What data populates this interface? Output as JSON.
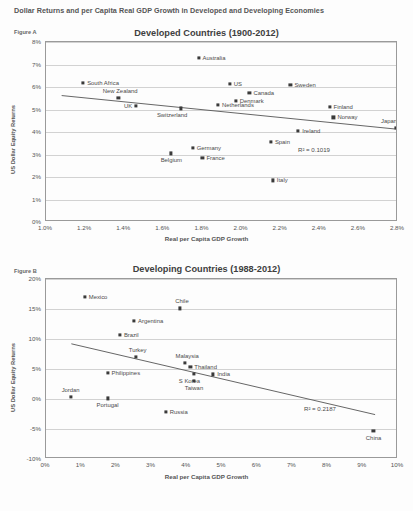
{
  "document": {
    "title": "Dollar Returns and per Capita Real GDP Growth in Developed and Developing Economies",
    "caption": ""
  },
  "figure_a": {
    "figure_label": "Figure A",
    "chart_data": {
      "type": "scatter",
      "title": "Developed Countries  (1900-2012)",
      "xlabel": "Real per Capita GDP Growth",
      "ylabel": "US Dollar Equity Returns",
      "xlim": [
        1.0,
        2.8
      ],
      "ylim": [
        0,
        8
      ],
      "xticks": [
        "1.0%",
        "1.2%",
        "1.4%",
        "1.6%",
        "1.8%",
        "2.0%",
        "2.2%",
        "2.4%",
        "2.6%",
        "2.8%"
      ],
      "yticks": [
        "0%",
        "1%",
        "2%",
        "3%",
        "4%",
        "5%",
        "6%",
        "7%",
        "8%"
      ],
      "grid": true,
      "legend": "none",
      "annotation": "R² = 0.1019",
      "trendline": {
        "x1": 1.08,
        "y1": 5.62,
        "x2": 2.8,
        "y2": 4.12
      },
      "points": [
        {
          "label": "Australia",
          "x": 1.78,
          "y": 7.3,
          "label_side": "right"
        },
        {
          "label": "South Africa",
          "x": 1.19,
          "y": 6.2,
          "label_side": "right"
        },
        {
          "label": "US",
          "x": 1.94,
          "y": 6.15,
          "label_side": "right"
        },
        {
          "label": "Sweden",
          "x": 2.25,
          "y": 6.1,
          "label_side": "right"
        },
        {
          "label": "Canada",
          "x": 2.04,
          "y": 5.75,
          "label_side": "right"
        },
        {
          "label": "New Zealand",
          "x": 1.37,
          "y": 5.5,
          "label_side": "above-right"
        },
        {
          "label": "Denmark",
          "x": 1.97,
          "y": 5.4,
          "label_side": "right"
        },
        {
          "label": "Netherlands",
          "x": 1.88,
          "y": 5.2,
          "label_side": "right"
        },
        {
          "label": "Finland",
          "x": 2.45,
          "y": 5.1,
          "label_side": "right"
        },
        {
          "label": "UK",
          "x": 1.46,
          "y": 5.15,
          "label_side": "left"
        },
        {
          "label": "Switzerland",
          "x": 1.69,
          "y": 5.05,
          "label_side": "below-left"
        },
        {
          "label": "Norway",
          "x": 2.47,
          "y": 4.65,
          "label_side": "right"
        },
        {
          "label": "Japan",
          "x": 2.79,
          "y": 4.2,
          "label_side": "above-left"
        },
        {
          "label": "Ireland",
          "x": 2.29,
          "y": 4.05,
          "label_side": "right"
        },
        {
          "label": "Spain",
          "x": 2.15,
          "y": 3.55,
          "label_side": "right"
        },
        {
          "label": "Germany",
          "x": 1.75,
          "y": 3.3,
          "label_side": "right"
        },
        {
          "label": "Belgium",
          "x": 1.64,
          "y": 3.05,
          "label_side": "below"
        },
        {
          "label": "France",
          "x": 1.8,
          "y": 2.85,
          "label_side": "right"
        },
        {
          "label": "Italy",
          "x": 2.16,
          "y": 1.85,
          "label_side": "right"
        }
      ]
    }
  },
  "figure_b": {
    "figure_label": "Figure B",
    "chart_data": {
      "type": "scatter",
      "title": "Developing Countries (1988-2012)",
      "xlabel": "Real per Capita GDP Growth",
      "ylabel": "US Dollar Equity Returns",
      "xlim": [
        0,
        10
      ],
      "ylim": [
        -10,
        20
      ],
      "xticks": [
        "0%",
        "1%",
        "2%",
        "3%",
        "4%",
        "5%",
        "6%",
        "7%",
        "8%",
        "9%",
        "10%"
      ],
      "yticks": [
        "20%",
        "15%",
        "10%",
        "5%",
        "0%",
        "-5%",
        "-10%"
      ],
      "grid": true,
      "legend": "none",
      "annotation": "R² = 0.2187",
      "trendline": {
        "x1": 0.72,
        "y1": 9.2,
        "x2": 9.35,
        "y2": -2.6
      },
      "points": [
        {
          "label": "Mexico",
          "x": 1.1,
          "y": 17.0,
          "label_side": "right"
        },
        {
          "label": "Chile",
          "x": 3.8,
          "y": 15.1,
          "label_side": "above-right"
        },
        {
          "label": "Argentina",
          "x": 2.5,
          "y": 13.0,
          "label_side": "right"
        },
        {
          "label": "Brazil",
          "x": 2.1,
          "y": 10.7,
          "label_side": "right"
        },
        {
          "label": "Turkey",
          "x": 2.55,
          "y": 7.0,
          "label_side": "above-right"
        },
        {
          "label": "Malaysia",
          "x": 3.95,
          "y": 6.0,
          "label_side": "above-right"
        },
        {
          "label": "Thailand",
          "x": 4.1,
          "y": 5.4,
          "label_side": "right"
        },
        {
          "label": "Philippines",
          "x": 1.75,
          "y": 4.3,
          "label_side": "right"
        },
        {
          "label": "S Korea",
          "x": 4.2,
          "y": 4.2,
          "label_side": "below-left"
        },
        {
          "label": "India",
          "x": 4.75,
          "y": 4.1,
          "label_side": "right"
        },
        {
          "label": "Taiwan",
          "x": 4.2,
          "y": 3.0,
          "label_side": "below"
        },
        {
          "label": "Jordan",
          "x": 0.7,
          "y": 0.3,
          "label_side": "above"
        },
        {
          "label": "Portugal",
          "x": 1.75,
          "y": 0.1,
          "label_side": "below"
        },
        {
          "label": "Russia",
          "x": 3.4,
          "y": -2.2,
          "label_side": "right"
        },
        {
          "label": "China",
          "x": 9.3,
          "y": -5.3,
          "label_side": "below"
        }
      ]
    }
  }
}
